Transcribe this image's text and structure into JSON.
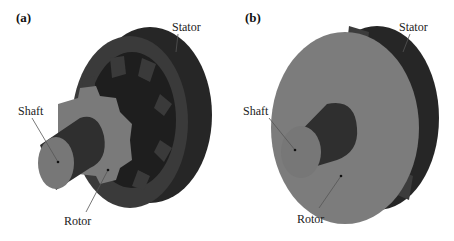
{
  "figure": {
    "panels": [
      {
        "id": "a",
        "label": "(a)",
        "callouts": {
          "stator": "Stator",
          "shaft": "Shaft",
          "rotor": "Rotor"
        }
      },
      {
        "id": "b",
        "label": "(b)",
        "callouts": {
          "stator": "Stator",
          "shaft": "Shaft",
          "rotor": "Rotor"
        }
      }
    ],
    "colors": {
      "stator_dark": "#2a2a2a",
      "stator_face": "#3c3c3c",
      "rotor_face": "#7a7a7a",
      "shaft_body": "#333333",
      "shaft_end": "#777777",
      "leader_line": "#555555"
    }
  }
}
